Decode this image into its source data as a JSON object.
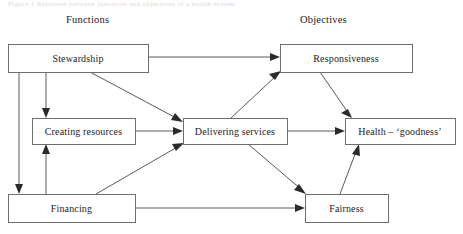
{
  "figure": {
    "cropped_caption": "Figure 1  Relations between functions and objectives of a health system",
    "column_headers": [
      {
        "id": "functions",
        "label": "Functions",
        "x": 66,
        "y": 14
      },
      {
        "id": "objectives",
        "label": "Objectives",
        "x": 300,
        "y": 14
      }
    ],
    "nodes": [
      {
        "id": "stewardship",
        "label": "Stewardship",
        "x": 8,
        "y": 44,
        "w": 140,
        "h": 28,
        "column": "functions"
      },
      {
        "id": "creating-resources",
        "label": "Creating resources",
        "x": 32,
        "y": 118,
        "w": 103,
        "h": 26,
        "column": "functions"
      },
      {
        "id": "financing",
        "label": "Financing",
        "x": 8,
        "y": 194,
        "w": 127,
        "h": 28,
        "column": "functions"
      },
      {
        "id": "delivering-services",
        "label": "Delivering services",
        "x": 183,
        "y": 118,
        "w": 104,
        "h": 26,
        "column": "functions"
      },
      {
        "id": "responsiveness",
        "label": "Responsiveness",
        "x": 280,
        "y": 44,
        "w": 132,
        "h": 28,
        "column": "objectives"
      },
      {
        "id": "health-goodness",
        "label": "Health – ‘goodness’",
        "x": 345,
        "y": 118,
        "w": 110,
        "h": 26,
        "column": "objectives"
      },
      {
        "id": "fairness",
        "label": "Fairness",
        "x": 305,
        "y": 194,
        "w": 83,
        "h": 28,
        "column": "objectives"
      }
    ],
    "edges": [
      {
        "id": "stewardship-to-responsiveness",
        "from": "stewardship",
        "to": "responsiveness",
        "kind": "horizontal"
      },
      {
        "id": "stewardship-to-financing",
        "from": "stewardship",
        "to": "financing",
        "kind": "vertical-left"
      },
      {
        "id": "stewardship-to-creating-resources",
        "from": "stewardship",
        "to": "creating-resources",
        "kind": "vertical"
      },
      {
        "id": "stewardship-to-delivering-services",
        "from": "stewardship",
        "to": "delivering-services",
        "kind": "diagonal"
      },
      {
        "id": "financing-to-creating-resources",
        "from": "financing",
        "to": "creating-resources",
        "kind": "vertical-up"
      },
      {
        "id": "financing-to-delivering-services",
        "from": "financing",
        "to": "delivering-services",
        "kind": "diagonal-up"
      },
      {
        "id": "financing-to-fairness",
        "from": "financing",
        "to": "fairness",
        "kind": "horizontal"
      },
      {
        "id": "creating-resources-to-delivering-services",
        "from": "creating-resources",
        "to": "delivering-services",
        "kind": "horizontal"
      },
      {
        "id": "delivering-services-to-responsiveness",
        "from": "delivering-services",
        "to": "responsiveness",
        "kind": "diagonal-up"
      },
      {
        "id": "delivering-services-to-health",
        "from": "delivering-services",
        "to": "health-goodness",
        "kind": "horizontal"
      },
      {
        "id": "delivering-services-to-fairness",
        "from": "delivering-services",
        "to": "fairness",
        "kind": "diagonal-down"
      },
      {
        "id": "responsiveness-to-health",
        "from": "responsiveness",
        "to": "health-goodness",
        "kind": "diagonal-down"
      },
      {
        "id": "fairness-to-health",
        "from": "fairness",
        "to": "health-goodness",
        "kind": "diagonal-up"
      }
    ],
    "colors": {
      "background": "#ffffff",
      "box_stroke": "#6e6e6e",
      "edge_stroke": "#5a5a5a",
      "arrow_fill": "#2b2b2b",
      "text": "#1c1c1c"
    }
  }
}
